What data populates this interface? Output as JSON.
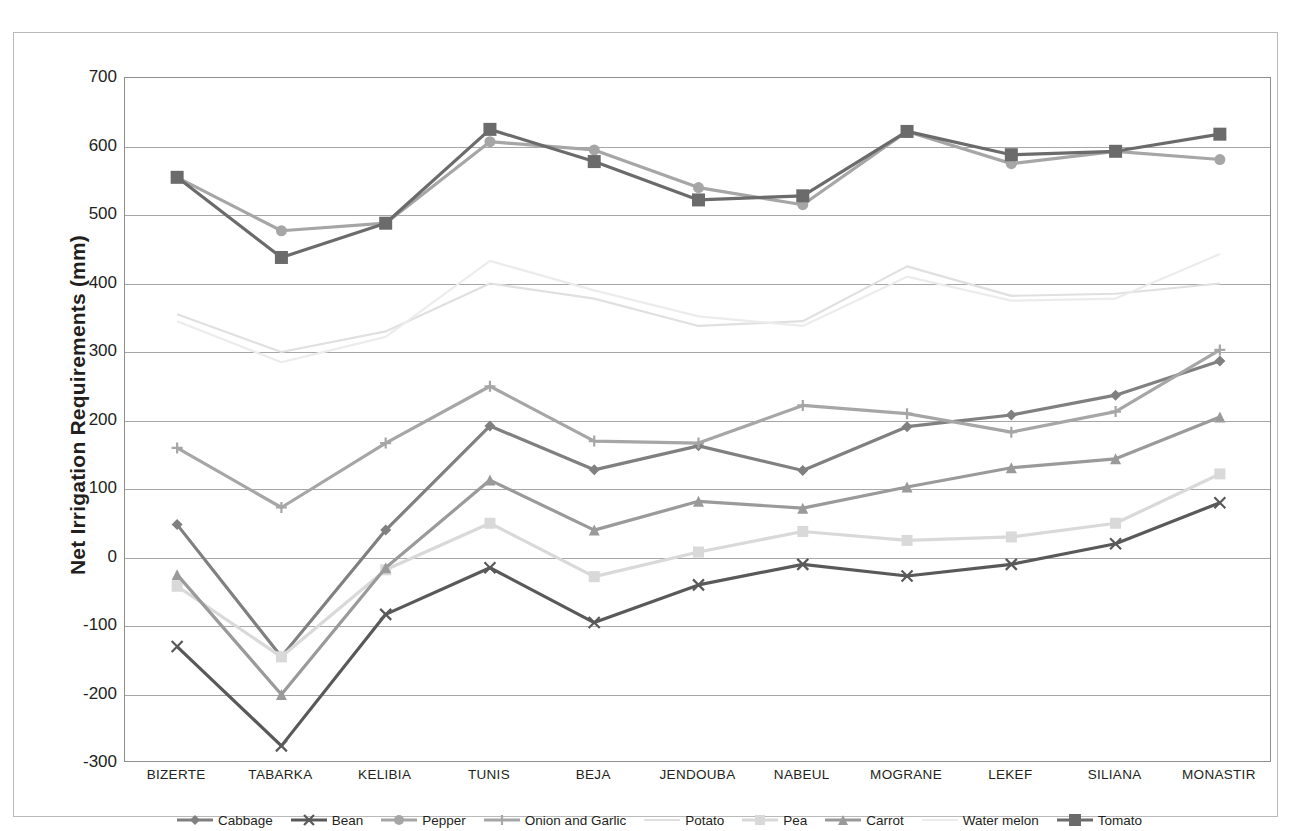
{
  "chart_data": {
    "type": "line",
    "title": "",
    "xlabel": "",
    "ylabel": "Net Irrigation Requirements  (mm)",
    "ylim": [
      -300,
      700
    ],
    "ytick_step": 100,
    "yticks": [
      700,
      600,
      500,
      400,
      300,
      200,
      100,
      0,
      -100,
      -200,
      -300
    ],
    "grid": true,
    "legend_position": "bottom",
    "categories": [
      "BIZERTE",
      "TABARKA",
      "KELIBIA",
      "TUNIS",
      "BEJA",
      "JENDOUBA",
      "NABEUL",
      "MOGRANE",
      "LEKEF",
      "SILIANA",
      "MONASTIR"
    ],
    "series": [
      {
        "name": "Cabbage",
        "marker": "diamond",
        "color": "#808080",
        "values": [
          48,
          -145,
          40,
          192,
          128,
          163,
          127,
          191,
          208,
          237,
          287
        ]
      },
      {
        "name": "Bean",
        "marker": "x",
        "color": "#595959",
        "values": [
          -130,
          -275,
          -83,
          -15,
          -95,
          -40,
          -10,
          -27,
          -10,
          20,
          80
        ]
      },
      {
        "name": "Pepper",
        "marker": "circle",
        "color": "#a6a6a6",
        "values": [
          555,
          477,
          488,
          607,
          595,
          540,
          515,
          622,
          575,
          593,
          581
        ]
      },
      {
        "name": "Onion and Garlic",
        "marker": "plus",
        "color": "#a6a6a6",
        "values": [
          160,
          73,
          167,
          250,
          170,
          167,
          222,
          210,
          183,
          213,
          303
        ]
      },
      {
        "name": "Potato",
        "marker": "line",
        "color": "#e0e0e0",
        "values": [
          355,
          300,
          330,
          400,
          378,
          338,
          345,
          425,
          382,
          385,
          400
        ]
      },
      {
        "name": "Pea",
        "marker": "square",
        "color": "#d9d9d9",
        "values": [
          -42,
          -145,
          -18,
          50,
          -28,
          8,
          38,
          25,
          30,
          50,
          122
        ]
      },
      {
        "name": "Carrot",
        "marker": "triangle",
        "color": "#9a9a9a",
        "values": [
          -25,
          -200,
          -15,
          113,
          40,
          82,
          72,
          103,
          131,
          144,
          205
        ]
      },
      {
        "name": "Water melon",
        "marker": "line",
        "color": "#ececec",
        "values": [
          345,
          285,
          322,
          433,
          390,
          352,
          338,
          410,
          375,
          378,
          443
        ]
      },
      {
        "name": "Tomato",
        "marker": "square-filled",
        "color": "#6b6b6b",
        "values": [
          555,
          438,
          488,
          625,
          578,
          522,
          528,
          622,
          588,
          593,
          618
        ]
      }
    ]
  }
}
